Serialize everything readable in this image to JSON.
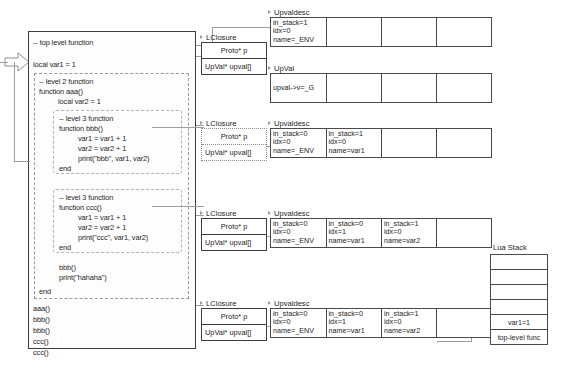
{
  "code_panel": {
    "lines": [
      "-- top level function",
      "local var1 = 1",
      "aaa()",
      "bbb()",
      "bbb()",
      "ccc()",
      "ccc()"
    ],
    "level2": {
      "comment": "-- level 2 function",
      "signature": "function aaa()",
      "local_decl": "local var2 = 1",
      "call_bbb": "bbb()",
      "print_hahaha": "print(\"hahaha\")",
      "end_kw": "end"
    },
    "level3_bbb": {
      "comment": "-- level 3 function",
      "signature": "function bbb()",
      "stmt1": "var1 = var1 + 1",
      "stmt2": "var2 = var2 + 1",
      "stmt3": "print(\"bbb\", var1, var2)",
      "end_kw": "end"
    },
    "level3_ccc": {
      "comment": "-- level 3 function",
      "signature": "function ccc()",
      "stmt1": "var1 = var1 + 1",
      "stmt2": "var2 = var2 + 1",
      "stmt3": "print(\"ccc\", var1, var2)",
      "end_kw": "end"
    }
  },
  "groups": [
    {
      "closure": {
        "title": "LClosure",
        "proto_label": "Proto* p",
        "upval_label": "UpVal* upval[]",
        "border": "solid"
      },
      "upvaldesc": {
        "title": "Upvaldesc",
        "columns": [
          {
            "in_stack": "in_stack=1",
            "idx": "idx=0",
            "name": "name=_ENV"
          },
          {
            "in_stack": "",
            "idx": "",
            "name": ""
          },
          {
            "in_stack": "",
            "idx": "",
            "name": ""
          },
          {
            "in_stack": "",
            "idx": "",
            "name": ""
          }
        ]
      },
      "upval": {
        "title": "UpVal",
        "columns": [
          {
            "value": "upval->v=_G"
          },
          {
            "value": ""
          },
          {
            "value": ""
          },
          {
            "value": ""
          }
        ]
      }
    },
    {
      "closure": {
        "title": "LClosure",
        "proto_label": "Proto* p",
        "upval_label": "UpVal* upval[]",
        "border": "dotted"
      },
      "upvaldesc": {
        "title": "Upvaldesc",
        "columns": [
          {
            "in_stack": "in_stack=0",
            "idx": "idx=0",
            "name": "name=_ENV"
          },
          {
            "in_stack": "in_stack=1",
            "idx": "idx=0",
            "name": "name=var1"
          },
          {
            "in_stack": "",
            "idx": "",
            "name": ""
          },
          {
            "in_stack": "",
            "idx": "",
            "name": ""
          }
        ]
      }
    },
    {
      "closure": {
        "title": "LClosure",
        "proto_label": "Proto* p",
        "upval_label": "UpVal* upval[]",
        "border": "solid"
      },
      "upvaldesc": {
        "title": "Upvaldesc",
        "columns": [
          {
            "in_stack": "in_stack=0",
            "idx": "idx=0",
            "name": "name=_ENV"
          },
          {
            "in_stack": "in_stack=0",
            "idx": "idx=1",
            "name": "name=var1"
          },
          {
            "in_stack": "in_stack=1",
            "idx": "idx=0",
            "name": "name=var2"
          },
          {
            "in_stack": "",
            "idx": "",
            "name": ""
          }
        ]
      }
    },
    {
      "closure": {
        "title": "LClosure",
        "proto_label": "Proto* p",
        "upval_label": "UpVal* upval[]",
        "border": "solid"
      },
      "upvaldesc": {
        "title": "Upvaldesc",
        "columns": [
          {
            "in_stack": "in_stack=0",
            "idx": "idx=0",
            "name": "name=_ENV"
          },
          {
            "in_stack": "in_stack=0",
            "idx": "idx=1",
            "name": "name=var1"
          },
          {
            "in_stack": "in_stack=1",
            "idx": "idx=0",
            "name": "name=var2"
          },
          {
            "in_stack": "",
            "idx": "",
            "name": ""
          }
        ]
      }
    }
  ],
  "lua_stack": {
    "label": "Lua Stack",
    "slots": [
      "",
      "",
      "",
      "",
      "var1=1",
      "top-level func"
    ]
  },
  "colors": {
    "line": "#9d9d9d",
    "box_border": "#4a4a4a",
    "text": "#1d1d1d",
    "background": "#ffffff"
  }
}
